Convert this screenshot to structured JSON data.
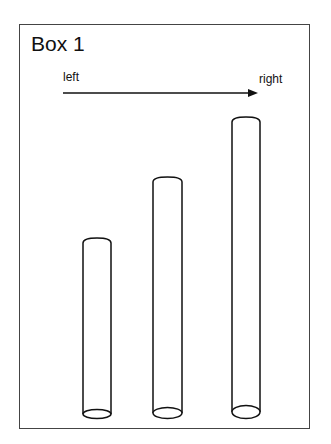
{
  "header": {
    "cropped_text": ""
  },
  "box": {
    "title": "Box 1",
    "arrow": {
      "left_label": "left",
      "right_label": "right",
      "direction": "left-to-right"
    },
    "cylinders": [
      {
        "id": "cylinder-1",
        "position": "left",
        "x": 83,
        "width": 28,
        "top": 238,
        "bottom": 414,
        "relative_height": "short"
      },
      {
        "id": "cylinder-2",
        "position": "middle",
        "x": 153,
        "width": 29,
        "top": 177,
        "bottom": 413,
        "relative_height": "medium"
      },
      {
        "id": "cylinder-3",
        "position": "right",
        "x": 232,
        "width": 28,
        "top": 117,
        "bottom": 412,
        "relative_height": "tall"
      }
    ]
  },
  "colors": {
    "stroke": "#111111",
    "border": "#444444",
    "background": "#ffffff"
  }
}
